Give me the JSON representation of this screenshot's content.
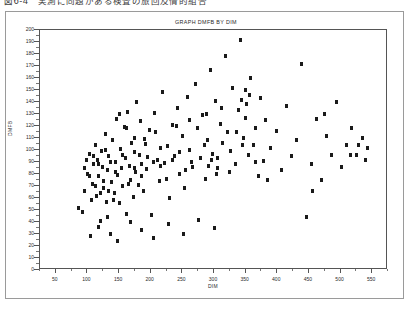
{
  "page": {
    "caption": "図6-4　実測に同題がある検査の旅回及情的組合"
  },
  "chart_data": {
    "type": "scatter",
    "title": "GRAPH DMFB BY DIM",
    "xlabel": "DIM",
    "ylabel": "DMFB",
    "xlim": [
      25,
      575
    ],
    "ylim": [
      0,
      200
    ],
    "xticks": [
      50,
      100,
      150,
      200,
      250,
      300,
      350,
      400,
      450,
      500,
      550
    ],
    "yticks": [
      0,
      10,
      20,
      30,
      40,
      50,
      60,
      70,
      80,
      90,
      100,
      110,
      120,
      130,
      140,
      150,
      160,
      170,
      180,
      190,
      200
    ],
    "grid": false,
    "legend": null,
    "marker": "square",
    "marker_color": "#1a1a1a",
    "points": [
      [
        86,
        52
      ],
      [
        92,
        48
      ],
      [
        96,
        66
      ],
      [
        100,
        80
      ],
      [
        103,
        97
      ],
      [
        106,
        58
      ],
      [
        108,
        72
      ],
      [
        110,
        88
      ],
      [
        112,
        104
      ],
      [
        114,
        62
      ],
      [
        116,
        92
      ],
      [
        118,
        78
      ],
      [
        120,
        41
      ],
      [
        122,
        99
      ],
      [
        124,
        86
      ],
      [
        126,
        68
      ],
      [
        128,
        113
      ],
      [
        130,
        57
      ],
      [
        132,
        83
      ],
      [
        134,
        95
      ],
      [
        136,
        30
      ],
      [
        138,
        73
      ],
      [
        140,
        108
      ],
      [
        142,
        64
      ],
      [
        144,
        90
      ],
      [
        146,
        126
      ],
      [
        148,
        79
      ],
      [
        150,
        56
      ],
      [
        152,
        101
      ],
      [
        154,
        85
      ],
      [
        156,
        70
      ],
      [
        158,
        119
      ],
      [
        160,
        93
      ],
      [
        162,
        47
      ],
      [
        164,
        132
      ],
      [
        166,
        87
      ],
      [
        168,
        75
      ],
      [
        170,
        106
      ],
      [
        172,
        61
      ],
      [
        174,
        98
      ],
      [
        176,
        82
      ],
      [
        178,
        140
      ],
      [
        180,
        71
      ],
      [
        182,
        96
      ],
      [
        184,
        124
      ],
      [
        186,
        88
      ],
      [
        188,
        66
      ],
      [
        190,
        109
      ],
      [
        194,
        84
      ],
      [
        198,
        117
      ],
      [
        202,
        46
      ],
      [
        206,
        131
      ],
      [
        210,
        92
      ],
      [
        214,
        74
      ],
      [
        218,
        148
      ],
      [
        222,
        89
      ],
      [
        226,
        103
      ],
      [
        230,
        60
      ],
      [
        234,
        121
      ],
      [
        238,
        95
      ],
      [
        242,
        135
      ],
      [
        246,
        80
      ],
      [
        250,
        112
      ],
      [
        254,
        68
      ],
      [
        258,
        144
      ],
      [
        262,
        100
      ],
      [
        266,
        86
      ],
      [
        270,
        155
      ],
      [
        274,
        118
      ],
      [
        278,
        93
      ],
      [
        282,
        129
      ],
      [
        286,
        76
      ],
      [
        290,
        108
      ],
      [
        294,
        167
      ],
      [
        298,
        97
      ],
      [
        302,
        141
      ],
      [
        306,
        85
      ],
      [
        310,
        122
      ],
      [
        314,
        106
      ],
      [
        318,
        178
      ],
      [
        322,
        115
      ],
      [
        326,
        99
      ],
      [
        330,
        152
      ],
      [
        334,
        88
      ],
      [
        338,
        133
      ],
      [
        342,
        192
      ],
      [
        346,
        110
      ],
      [
        350,
        127
      ],
      [
        354,
        96
      ],
      [
        358,
        160
      ],
      [
        362,
        104
      ],
      [
        366,
        118
      ],
      [
        370,
        78
      ],
      [
        374,
        143
      ],
      [
        378,
        91
      ],
      [
        382,
        125
      ],
      [
        390,
        102
      ],
      [
        398,
        116
      ],
      [
        406,
        83
      ],
      [
        414,
        137
      ],
      [
        422,
        95
      ],
      [
        430,
        108
      ],
      [
        438,
        172
      ],
      [
        446,
        44
      ],
      [
        454,
        88
      ],
      [
        462,
        126
      ],
      [
        470,
        75
      ],
      [
        478,
        112
      ],
      [
        486,
        96
      ],
      [
        494,
        140
      ],
      [
        502,
        86
      ],
      [
        510,
        104
      ],
      [
        518,
        118
      ],
      [
        526,
        96
      ],
      [
        534,
        110
      ],
      [
        542,
        102
      ],
      [
        105,
        28
      ],
      [
        118,
        36
      ],
      [
        131,
        44
      ],
      [
        148,
        24
      ],
      [
        168,
        40
      ],
      [
        186,
        33
      ],
      [
        205,
        27
      ],
      [
        228,
        38
      ],
      [
        252,
        30
      ],
      [
        276,
        42
      ],
      [
        300,
        35
      ],
      [
        205,
        90
      ],
      [
        215,
        87
      ],
      [
        235,
        92
      ],
      [
        255,
        83
      ],
      [
        150,
        130
      ],
      [
        162,
        118
      ],
      [
        175,
        110
      ],
      [
        192,
        105
      ],
      [
        208,
        115
      ],
      [
        240,
        120
      ],
      [
        262,
        125
      ],
      [
        288,
        130
      ],
      [
        312,
        135
      ],
      [
        336,
        115
      ],
      [
        95,
        85
      ],
      [
        99,
        92
      ],
      [
        104,
        78
      ],
      [
        109,
        95
      ],
      [
        113,
        70
      ],
      [
        117,
        88
      ],
      [
        121,
        64
      ],
      [
        125,
        74
      ],
      [
        129,
        100
      ],
      [
        133,
        66
      ],
      [
        137,
        90
      ],
      [
        141,
        58
      ],
      [
        145,
        82
      ],
      [
        155,
        96
      ],
      [
        165,
        72
      ],
      [
        175,
        85
      ],
      [
        185,
        78
      ],
      [
        195,
        94
      ],
      [
        215,
        102
      ],
      [
        225,
        76
      ],
      [
        245,
        98
      ],
      [
        265,
        90
      ],
      [
        285,
        104
      ],
      [
        305,
        93
      ],
      [
        325,
        82
      ],
      [
        345,
        104
      ],
      [
        365,
        90
      ],
      [
        385,
        75
      ],
      [
        455,
        66
      ],
      [
        475,
        130
      ],
      [
        515,
        96
      ],
      [
        528,
        104
      ],
      [
        540,
        92
      ],
      [
        350,
        150
      ],
      [
        356,
        146
      ],
      [
        344,
        142
      ],
      [
        352,
        138
      ],
      [
        292,
        87
      ],
      [
        296,
        92
      ],
      [
        304,
        80
      ]
    ]
  }
}
